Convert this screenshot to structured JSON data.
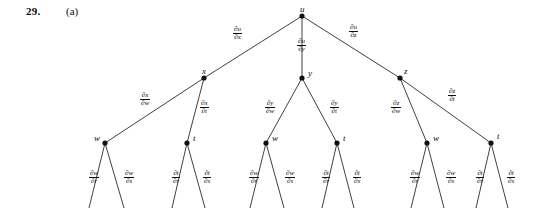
{
  "header": {
    "problem_number": "29.",
    "part_label": "(a)"
  },
  "diagram": {
    "type": "chain-rule-tree",
    "node_color": "#111111",
    "edge_color": "#2a2a2a",
    "nodes": [
      {
        "id": "u",
        "label": "u",
        "x": 302,
        "y": 16,
        "label_dx": -2,
        "label_dy": -11,
        "level": 0
      },
      {
        "id": "x",
        "label": "x",
        "x": 204,
        "y": 78,
        "label_dx": -2,
        "label_dy": -11,
        "level": 1
      },
      {
        "id": "y",
        "label": "y",
        "x": 302,
        "y": 78,
        "label_dx": 6,
        "label_dy": -9,
        "level": 1
      },
      {
        "id": "z",
        "label": "z",
        "x": 400,
        "y": 78,
        "label_dx": 4,
        "label_dy": -11,
        "level": 1
      },
      {
        "id": "w1",
        "label": "w",
        "x": 105,
        "y": 143,
        "label_dx": -11,
        "label_dy": -9,
        "level": 2
      },
      {
        "id": "t1",
        "label": "t",
        "x": 187,
        "y": 143,
        "label_dx": 6,
        "label_dy": -9,
        "level": 2
      },
      {
        "id": "w2",
        "label": "w",
        "x": 266,
        "y": 143,
        "label_dx": 6,
        "label_dy": -9,
        "level": 2
      },
      {
        "id": "t2",
        "label": "t",
        "x": 337,
        "y": 143,
        "label_dx": 6,
        "label_dy": -9,
        "level": 2
      },
      {
        "id": "w3",
        "label": "w",
        "x": 427,
        "y": 143,
        "label_dx": 6,
        "label_dy": -9,
        "level": 2
      },
      {
        "id": "t3",
        "label": "t",
        "x": 491,
        "y": 143,
        "label_dx": 6,
        "label_dy": -11,
        "level": 2
      }
    ],
    "edges": [
      {
        "from": "u",
        "to": "x",
        "num": "∂u",
        "den": "∂x",
        "lx": 233,
        "ly": 26
      },
      {
        "from": "u",
        "to": "y",
        "num": "∂u",
        "den": "∂y",
        "lx": 297,
        "ly": 38
      },
      {
        "from": "u",
        "to": "z",
        "num": "∂u",
        "den": "∂z",
        "lx": 349,
        "ly": 24
      },
      {
        "from": "x",
        "to": "w1",
        "num": "∂x",
        "den": "∂w",
        "lx": 140,
        "ly": 92
      },
      {
        "from": "x",
        "to": "t1",
        "num": "∂x",
        "den": "∂t",
        "lx": 200,
        "ly": 100
      },
      {
        "from": "y",
        "to": "w2",
        "num": "∂y",
        "den": "∂w",
        "lx": 265,
        "ly": 100
      },
      {
        "from": "y",
        "to": "t2",
        "num": "∂y",
        "den": "∂t",
        "lx": 330,
        "ly": 100
      },
      {
        "from": "z",
        "to": "w3",
        "num": "∂z",
        "den": "∂w",
        "lx": 391,
        "ly": 100
      },
      {
        "from": "z",
        "to": "t3",
        "num": "∂z",
        "den": "∂t",
        "lx": 448,
        "ly": 88
      },
      {
        "from": "w1",
        "to": "r1",
        "num": "∂w",
        "den": "∂r",
        "lx": 89,
        "ly": 170
      },
      {
        "from": "w1",
        "to": "s1",
        "num": "∂w",
        "den": "∂s",
        "lx": 124,
        "ly": 170
      },
      {
        "from": "t1",
        "to": "r2",
        "num": "∂t",
        "den": "∂r",
        "lx": 172,
        "ly": 170
      },
      {
        "from": "t1",
        "to": "s2",
        "num": "∂t",
        "den": "∂s",
        "lx": 203,
        "ly": 170
      },
      {
        "from": "w2",
        "to": "r3",
        "num": "∂w",
        "den": "∂r",
        "lx": 249,
        "ly": 170
      },
      {
        "from": "w2",
        "to": "s3",
        "num": "∂w",
        "den": "∂s",
        "lx": 285,
        "ly": 170
      },
      {
        "from": "t2",
        "to": "r4",
        "num": "∂t",
        "den": "∂r",
        "lx": 322,
        "ly": 170
      },
      {
        "from": "t2",
        "to": "s4",
        "num": "∂t",
        "den": "∂s",
        "lx": 353,
        "ly": 170
      },
      {
        "from": "w3",
        "to": "r5",
        "num": "∂w",
        "den": "∂r",
        "lx": 410,
        "ly": 170
      },
      {
        "from": "w3",
        "to": "s5",
        "num": "∂w",
        "den": "∂s",
        "lx": 446,
        "ly": 170
      },
      {
        "from": "t3",
        "to": "r6",
        "num": "∂t",
        "den": "∂r",
        "lx": 476,
        "ly": 170
      },
      {
        "from": "t3",
        "to": "s6",
        "num": "∂t",
        "den": "∂s",
        "lx": 507,
        "ly": 170
      }
    ],
    "leaf_stubs": [
      {
        "from": "w1",
        "x2": 89,
        "y2": 208
      },
      {
        "from": "w1",
        "x2": 124,
        "y2": 208
      },
      {
        "from": "t1",
        "x2": 172,
        "y2": 208
      },
      {
        "from": "t1",
        "x2": 205,
        "y2": 208
      },
      {
        "from": "w2",
        "x2": 250,
        "y2": 208
      },
      {
        "from": "w2",
        "x2": 284,
        "y2": 208
      },
      {
        "from": "t2",
        "x2": 322,
        "y2": 208
      },
      {
        "from": "t2",
        "x2": 354,
        "y2": 208
      },
      {
        "from": "w3",
        "x2": 411,
        "y2": 208
      },
      {
        "from": "w3",
        "x2": 444,
        "y2": 208
      },
      {
        "from": "t3",
        "x2": 476,
        "y2": 208
      },
      {
        "from": "t3",
        "x2": 508,
        "y2": 208
      }
    ]
  }
}
